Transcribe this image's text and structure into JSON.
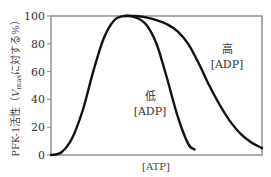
{
  "chart_data": {
    "type": "line",
    "title": "",
    "xlabel": "[ATP]",
    "ylabel": "PFK-1活性（Vmaxに対する%）",
    "ylabel_parts": {
      "prefix": "PFK-1活性（",
      "v": "V",
      "sub": "max",
      "suffix": "に対する%）"
    },
    "ylim": [
      0,
      100
    ],
    "xlim": [
      0,
      10
    ],
    "yticks": [
      0,
      20,
      40,
      60,
      80,
      100
    ],
    "xticks": [],
    "grid": false,
    "series": [
      {
        "name": "低[ADP]",
        "label_line1": "低",
        "label_line2": "[ADP]",
        "x": [
          0,
          0.5,
          1.0,
          1.5,
          2.0,
          2.5,
          3.0,
          3.5,
          4.0,
          4.5,
          5.0,
          5.5,
          6.0,
          6.5,
          6.8
        ],
        "y": [
          0,
          2,
          12,
          32,
          60,
          84,
          97,
          100,
          99,
          94,
          80,
          55,
          28,
          8,
          4
        ]
      },
      {
        "name": "高[ADP]",
        "label_line1": "高",
        "label_line2": "[ADP]",
        "x": [
          3.5,
          4.0,
          4.5,
          5.0,
          5.5,
          6.0,
          6.5,
          7.0,
          7.5,
          8.0,
          8.5,
          9.0,
          9.5,
          10.0
        ],
        "y": [
          100,
          100,
          99,
          97,
          94,
          89,
          80,
          66,
          50,
          36,
          24,
          15,
          9,
          5
        ]
      }
    ]
  }
}
